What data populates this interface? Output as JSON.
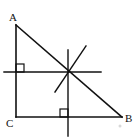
{
  "diagram": {
    "stroke_color": "#111111",
    "background": "#ffffff",
    "vertices": {
      "A": {
        "label": "A",
        "x": 16,
        "y": 25,
        "label_x": 9,
        "label_y": 21
      },
      "B": {
        "label": "B",
        "x": 122,
        "y": 117,
        "label_x": 125,
        "label_y": 122
      },
      "C": {
        "label": "C",
        "x": 16,
        "y": 117,
        "label_x": 6,
        "label_y": 127
      }
    },
    "sides": [
      {
        "name": "AC",
        "x1": 16,
        "y1": 25,
        "x2": 16,
        "y2": 117
      },
      {
        "name": "CB",
        "x1": 16,
        "y1": 117,
        "x2": 122,
        "y2": 117
      },
      {
        "name": "AB",
        "x1": 16,
        "y1": 25,
        "x2": 122,
        "y2": 117
      }
    ],
    "construction_lines": [
      {
        "name": "perpendicular-bisector-AC",
        "x1": 4,
        "y1": 72,
        "x2": 101,
        "y2": 72
      },
      {
        "name": "perpendicular-bisector-CB",
        "x1": 68,
        "y1": 50,
        "x2": 68,
        "y2": 136
      },
      {
        "name": "third-line",
        "x1": 55,
        "y1": 92,
        "x2": 86,
        "y2": 46
      }
    ],
    "right_angle_marks": [
      {
        "name": "right-angle-on-AC",
        "x": 16,
        "y": 64,
        "size": 8
      },
      {
        "name": "right-angle-on-CB",
        "x": 60,
        "y": 109,
        "size": 8
      }
    ],
    "intersection_point": {
      "x": 68,
      "y": 71
    },
    "artifact_dot": {
      "x": 120,
      "y": 126,
      "r": 1.5,
      "color": "#d8d8d8"
    }
  }
}
